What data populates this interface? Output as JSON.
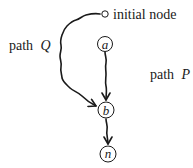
{
  "diagram": {
    "initial_node": {
      "label": "initial node"
    },
    "nodes": [
      {
        "id": "a",
        "label": "a"
      },
      {
        "id": "b",
        "label": "b"
      },
      {
        "id": "n",
        "label": "n"
      }
    ],
    "edges": [
      {
        "from": "initial",
        "to": "b",
        "label": "path Q",
        "style": "wavy"
      },
      {
        "from": "a",
        "to": "b",
        "label": "path P",
        "style": "wavy"
      },
      {
        "from": "b",
        "to": "n",
        "label": "",
        "style": "wavy"
      }
    ],
    "labels": {
      "path_q_word": "path",
      "path_q_var": "Q",
      "path_p_word": "path",
      "path_p_var": "P"
    }
  }
}
